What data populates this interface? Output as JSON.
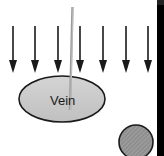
{
  "diagram": {
    "vein_label": "Vein",
    "arrow_count": 7,
    "colors": {
      "arrow": "#1a1a1a",
      "vein_fill": "#c9c9c9",
      "vein_stroke": "#1a1a1a",
      "needle": "#9a9a9a",
      "artery_fill": "#8c8c8c",
      "bar": "#000000"
    }
  }
}
